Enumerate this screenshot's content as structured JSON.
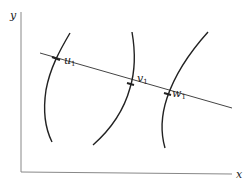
{
  "figure": {
    "axes": {
      "x_label": "x",
      "y_label": "y",
      "color": "#888888"
    },
    "curve_color": "#222222",
    "transversal_color": "#444444",
    "points": [
      {
        "name": "u",
        "subscript": "1"
      },
      {
        "name": "v",
        "subscript": "1"
      },
      {
        "name": "w",
        "subscript": "1"
      }
    ]
  }
}
